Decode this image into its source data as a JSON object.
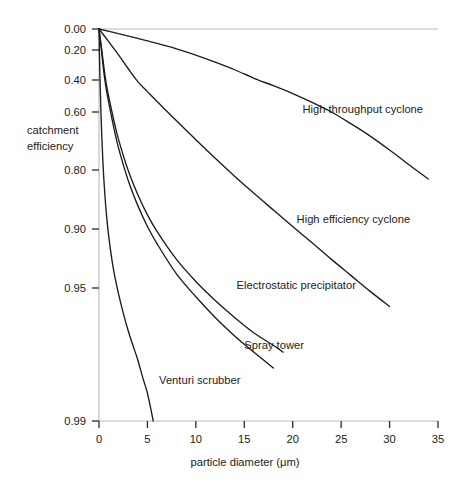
{
  "chart_data": {
    "type": "line",
    "title": "",
    "subtitle": "",
    "xlabel": "particle diameter (μm)",
    "ylabel": "catchment efficiency",
    "xlim": [
      0,
      35
    ],
    "ylim_labels": [
      "0.00",
      "0.20",
      "0.40",
      "0.60",
      "0.80",
      "0.90",
      "0.95",
      "0.99"
    ],
    "grid": false,
    "legend_position": "inline-annotations",
    "x_ticks": [
      {
        "value": 0,
        "label": "0"
      },
      {
        "value": 5,
        "label": "5"
      },
      {
        "value": 10,
        "label": "10"
      },
      {
        "value": 15,
        "label": "15"
      },
      {
        "value": 20,
        "label": "20"
      },
      {
        "value": 25,
        "label": "25"
      },
      {
        "value": 30,
        "label": "30"
      },
      {
        "value": 35,
        "label": "35"
      }
    ],
    "y_ticks": [
      {
        "value": 0.0,
        "label": "0.00"
      },
      {
        "value": 0.2,
        "label": "0.20"
      },
      {
        "value": 0.4,
        "label": "0.40"
      },
      {
        "value": 0.6,
        "label": "0.60"
      },
      {
        "value": 0.8,
        "label": "0.80"
      },
      {
        "value": 0.9,
        "label": "0.90"
      },
      {
        "value": 0.95,
        "label": "0.95"
      },
      {
        "value": 0.99,
        "label": "0.99"
      }
    ],
    "series": [
      {
        "name": "High throughput cyclone",
        "label": "High throughput cyclone",
        "label_x": 21.0,
        "label_y": 0.585,
        "points": [
          [
            0.0,
            0.0
          ],
          [
            2.0,
            0.048
          ],
          [
            4.0,
            0.095
          ],
          [
            6.0,
            0.142
          ],
          [
            8.0,
            0.19
          ],
          [
            10.0,
            0.238
          ],
          [
            12.0,
            0.288
          ],
          [
            14.0,
            0.338
          ],
          [
            16.0,
            0.39
          ],
          [
            18.0,
            0.442
          ],
          [
            20.0,
            0.495
          ],
          [
            22.0,
            0.548
          ],
          [
            24.0,
            0.6
          ],
          [
            26.0,
            0.652
          ],
          [
            28.0,
            0.7
          ],
          [
            30.0,
            0.746
          ],
          [
            32.0,
            0.787
          ],
          [
            34.0,
            0.82
          ]
        ]
      },
      {
        "name": "High efficiency cyclone",
        "label": "High efficiency cyclone",
        "label_x": 20.4,
        "label_y": 0.888,
        "points": [
          [
            0.0,
            0.0
          ],
          [
            1.0,
            0.125
          ],
          [
            2.0,
            0.235
          ],
          [
            3.0,
            0.33
          ],
          [
            4.0,
            0.412
          ],
          [
            5.0,
            0.482
          ],
          [
            6.0,
            0.543
          ],
          [
            8.0,
            0.64
          ],
          [
            10.0,
            0.713
          ],
          [
            12.0,
            0.77
          ],
          [
            14.0,
            0.814
          ],
          [
            16.0,
            0.848
          ],
          [
            18.0,
            0.875
          ],
          [
            20.0,
            0.897
          ],
          [
            22.0,
            0.915
          ],
          [
            24.0,
            0.93
          ],
          [
            26.0,
            0.942
          ],
          [
            28.0,
            0.952
          ],
          [
            30.0,
            0.96
          ]
        ]
      },
      {
        "name": "Electrostatic precipitator",
        "label": "Electrostatic precipitator",
        "label_x": 14.2,
        "label_y": 0.948,
        "points": [
          [
            0.0,
            0.0
          ],
          [
            0.25,
            0.175
          ],
          [
            0.5,
            0.32
          ],
          [
            0.75,
            0.428
          ],
          [
            1.0,
            0.513
          ],
          [
            1.5,
            0.632
          ],
          [
            2.0,
            0.71
          ],
          [
            3.0,
            0.8
          ],
          [
            4.0,
            0.85
          ],
          [
            5.0,
            0.882
          ],
          [
            6.0,
            0.903
          ],
          [
            8.0,
            0.93
          ],
          [
            10.0,
            0.946
          ],
          [
            12.0,
            0.957
          ],
          [
            14.0,
            0.965
          ],
          [
            16.0,
            0.971
          ],
          [
            18.0,
            0.975
          ],
          [
            19.0,
            0.977
          ]
        ]
      },
      {
        "name": "Spray tower",
        "label": "Spray tower",
        "label_x": 15.0,
        "label_y": 0.975,
        "points": [
          [
            0.0,
            0.0
          ],
          [
            0.25,
            0.2
          ],
          [
            0.5,
            0.355
          ],
          [
            0.75,
            0.465
          ],
          [
            1.0,
            0.548
          ],
          [
            1.5,
            0.663
          ],
          [
            2.0,
            0.738
          ],
          [
            3.0,
            0.822
          ],
          [
            4.0,
            0.868
          ],
          [
            5.0,
            0.897
          ],
          [
            6.0,
            0.916
          ],
          [
            8.0,
            0.941
          ],
          [
            10.0,
            0.955
          ],
          [
            12.0,
            0.965
          ],
          [
            14.0,
            0.972
          ],
          [
            16.0,
            0.977
          ],
          [
            18.0,
            0.981
          ]
        ]
      },
      {
        "name": "Venturi scrubber",
        "label": "Venturi scrubber",
        "label_x": 6.2,
        "label_y": 0.9835,
        "points": [
          [
            0.0,
            0.0
          ],
          [
            0.1,
            0.39
          ],
          [
            0.2,
            0.6
          ],
          [
            0.3,
            0.712
          ],
          [
            0.4,
            0.778
          ],
          [
            0.5,
            0.82
          ],
          [
            0.7,
            0.87
          ],
          [
            1.0,
            0.908
          ],
          [
            1.5,
            0.938
          ],
          [
            2.0,
            0.953
          ],
          [
            2.5,
            0.963
          ],
          [
            3.0,
            0.97
          ],
          [
            3.5,
            0.975
          ],
          [
            4.0,
            0.979
          ],
          [
            4.5,
            0.983
          ],
          [
            5.0,
            0.986
          ],
          [
            5.6,
            0.99
          ]
        ]
      }
    ]
  },
  "axes": {
    "y_axis_title_line1": "catchment",
    "y_axis_title_line2": "efficiency",
    "x_axis_title": "particle diameter (μm)"
  },
  "colors": {
    "background": "#ffffff",
    "axis_line": "#b9b9b9",
    "tick_mark": "#2b2b2b",
    "curve": "#1c1c1c",
    "text": "#1b1b1b"
  }
}
